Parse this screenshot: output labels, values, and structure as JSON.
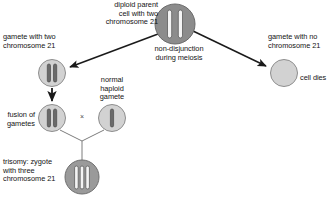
{
  "diagram": {
    "background_color": "#ffffff",
    "labels": {
      "parent_cell": "diploid parent\ncell with two\nchromosome 21",
      "non_disjunction": "non-disjunction\nduring meiosis",
      "left_gamete": "gamete with two\nchromosome 21",
      "right_gamete": "gamete with no\nchromosome 21",
      "cell_dies": "cell dies",
      "fusion_of_gametes": "fusion of\ngametes",
      "normal_haploid_gamete": "normal\nhaploid\ngamete",
      "trisomy_zygote": "trisomy: zygote\nwith three\nchromosome 21",
      "cross_symbol": "×"
    },
    "colors": {
      "parent_cell_fill": "#8c8c8c",
      "parent_cell_stroke": "#6b6b6b",
      "gamete_fill": "#d2d2d2",
      "gamete_stroke": "#8e8e8e",
      "zygote_fill": "#9a9a9a",
      "zygote_stroke": "#6f6f6f",
      "chromosome_light_fill": "#f4f4f4",
      "chromosome_light_stroke": "#5d5d5d",
      "chromosome_dark_fill": "#6a6a6a",
      "chromosome_dark_stroke": "#4a4a4a",
      "arrow_color": "#1a1a1a",
      "connector_color": "#7c7c7c",
      "text_color": "#141414"
    },
    "cells": [
      {
        "id": "parent-cell",
        "name": "diploid parent cell",
        "cx": 175,
        "cy": 24,
        "r": 20,
        "chromosome_count": 2,
        "chromosome_style": "light",
        "fill": "#8c8c8c"
      },
      {
        "id": "left-gamete-cell",
        "name": "gamete with two chromosome 21",
        "cx": 52,
        "cy": 73,
        "r": 13.5,
        "chromosome_count": 2,
        "chromosome_style": "dark",
        "fill": "#d2d2d2"
      },
      {
        "id": "right-gamete-cell",
        "name": "gamete with no chromosome 21",
        "cx": 284,
        "cy": 73,
        "r": 13.5,
        "chromosome_count": 0,
        "chromosome_style": "none",
        "fill": "#d2d2d2"
      },
      {
        "id": "fusion-gamete-cell",
        "name": "fusion gamete with two chromosome 21",
        "cx": 52,
        "cy": 118,
        "r": 13.5,
        "chromosome_count": 2,
        "chromosome_style": "dark",
        "fill": "#d2d2d2"
      },
      {
        "id": "normal-gamete-cell",
        "name": "normal haploid gamete",
        "cx": 112,
        "cy": 118,
        "r": 13.5,
        "chromosome_count": 1,
        "chromosome_style": "dark",
        "fill": "#d2d2d2"
      },
      {
        "id": "zygote-cell",
        "name": "trisomy zygote with three chromosome 21",
        "cx": 82,
        "cy": 177,
        "r": 17,
        "chromosome_count": 3,
        "chromosome_style": "light",
        "fill": "#9a9a9a"
      }
    ],
    "arrows": [
      {
        "id": "arrow-parent-to-left-gamete",
        "from": [
          158,
          34
        ],
        "to": [
          68,
          68
        ]
      },
      {
        "id": "arrow-parent-to-right-gamete",
        "from": [
          193,
          31
        ],
        "to": [
          268,
          67
        ]
      },
      {
        "id": "arrow-left-gamete-to-fusion",
        "from": [
          52,
          88
        ],
        "to": [
          52,
          103
        ]
      }
    ],
    "connectors": [
      {
        "id": "connector-fusion-to-junction",
        "from": [
          60,
          130
        ],
        "to": [
          82,
          141
        ]
      },
      {
        "id": "connector-normal-to-junction",
        "from": [
          104,
          130
        ],
        "to": [
          82,
          141
        ]
      },
      {
        "id": "connector-junction-to-zygote",
        "from": [
          82,
          141
        ],
        "to": [
          82,
          160
        ]
      }
    ]
  }
}
